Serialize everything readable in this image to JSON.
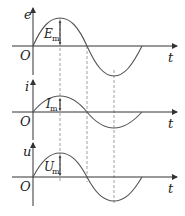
{
  "diagram": {
    "colors": {
      "axis": "#333333",
      "curve": "#555555",
      "dashed": "#888888",
      "text": "#222222"
    },
    "origin_label": "O",
    "time_label": "t",
    "panels": [
      {
        "id": "emf",
        "y_label": "e",
        "amplitude_label": "E",
        "amplitude_sub": "m"
      },
      {
        "id": "current",
        "y_label": "i",
        "amplitude_label": "I",
        "amplitude_sub": "m"
      },
      {
        "id": "voltage",
        "y_label": "u",
        "amplitude_label": "U",
        "amplitude_sub": "m"
      }
    ]
  }
}
